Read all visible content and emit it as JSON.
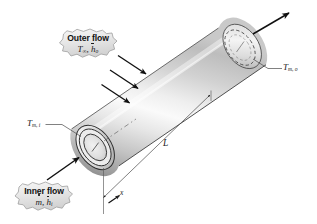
{
  "figure": {
    "domain_type": "engineering-schematic",
    "background_color": "#ffffff"
  },
  "callouts": [
    {
      "id": "outer-flow",
      "title": "Outer flow",
      "symbols": "T∞, h̄o",
      "symbol_parts": {
        "temperature": "T",
        "temperature_sub": "∞",
        "coefficient": "h",
        "coefficient_sub": "o"
      }
    },
    {
      "id": "inner-flow",
      "title": "Inner flow",
      "symbols": "ṁ, h̄i",
      "symbol_parts": {
        "massflow": "m",
        "coefficient": "h",
        "coefficient_sub": "i"
      }
    }
  ],
  "labels": {
    "inlet_temp": {
      "base": "T",
      "sub": "m, i",
      "full": "Tm,i"
    },
    "outlet_temp": {
      "base": "T",
      "sub": "m, o",
      "full": "Tm,o"
    },
    "length": "L",
    "axis": "x"
  },
  "colors": {
    "stroke": "#1a1a1a",
    "tube_light": "#fdfdfd",
    "tube_mid": "#d9d9d9",
    "tube_dark": "#9a9a9a",
    "tube_shadow": "#7d7d7d",
    "callout_fill": "#e9e9e9",
    "callout_edge": "#9a9a9a",
    "dimension_line": "#5a5a5a",
    "background": "#ffffff"
  },
  "elements": {
    "tube": "circular-tube-3d",
    "inlet_face": "annulus-solid",
    "outlet_face": "annulus-dashed-hidden",
    "outer_flow_arrows_count": 3,
    "inner_flow_arrow": "inlet-arrow",
    "outlet_flow_arrow": "outlet-arrow",
    "dimension": "length-dimension-L",
    "axis_marker": "x-axis-arrow"
  }
}
